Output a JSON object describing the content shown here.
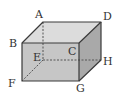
{
  "diagram": {
    "type": "cuboid",
    "colors": {
      "top_face": "#dcdcdc",
      "front_face": "#c6c6c6",
      "side_face": "#a9a9a9",
      "edge": "#3a3a3a",
      "hidden_edge": "#555555"
    },
    "vertices": {
      "A": {
        "label": "A",
        "x": 43,
        "y": 22
      },
      "B": {
        "label": "B",
        "x": 22,
        "y": 43
      },
      "C": {
        "label": "C",
        "x": 79,
        "y": 43
      },
      "D": {
        "label": "D",
        "x": 101,
        "y": 22
      },
      "E": {
        "label": "E",
        "x": 43,
        "y": 60
      },
      "F": {
        "label": "F",
        "x": 22,
        "y": 81
      },
      "G": {
        "label": "G",
        "x": 79,
        "y": 81
      },
      "H": {
        "label": "H",
        "x": 101,
        "y": 60
      }
    },
    "hidden_edges": [
      "AE",
      "EF",
      "EH"
    ]
  }
}
